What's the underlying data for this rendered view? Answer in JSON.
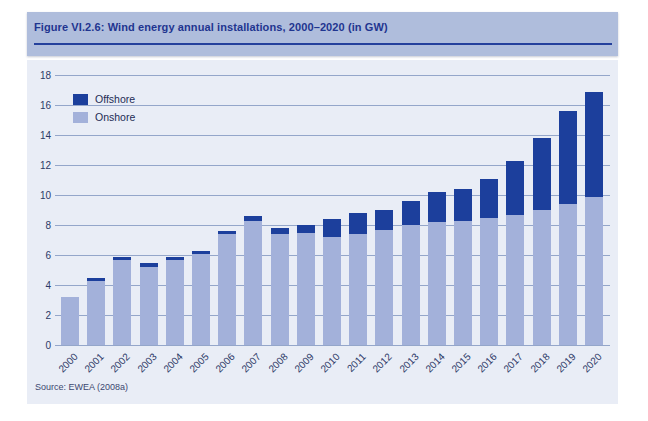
{
  "figure": {
    "title": "Figure VI.2.6: Wind energy annual installations, 2000–2020 (in GW)",
    "source": "Source: EWEA (2008a)"
  },
  "colors": {
    "title_band": "#afbddc",
    "panel_bg": "#e9edf6",
    "offshore": "#1c3f9c",
    "onshore": "#a3b1da",
    "gridline": "#94a6ca",
    "title_text": "#1f3590",
    "underline": "#24409c",
    "axis_text": "#2c3966",
    "source_text": "#3c4870"
  },
  "chart_data": {
    "type": "bar",
    "stacked": true,
    "title": "Wind energy annual installations, 2000–2020",
    "unit": "GW",
    "xlabel": "",
    "ylabel": "",
    "ylim": [
      0,
      18
    ],
    "yticks": [
      0,
      2,
      4,
      6,
      8,
      10,
      12,
      14,
      16,
      18
    ],
    "grid": true,
    "legend": [
      "Offshore",
      "Onshore"
    ],
    "legend_position": "upper-left",
    "categories": [
      "2000",
      "2001",
      "2002",
      "2003",
      "2004",
      "2005",
      "2006",
      "2007",
      "2008",
      "2009",
      "2010",
      "2011",
      "2012",
      "2013",
      "2014",
      "2015",
      "2016",
      "2017",
      "2018",
      "2019",
      "2020"
    ],
    "series": [
      {
        "name": "Onshore",
        "values": [
          3.2,
          4.3,
          5.7,
          5.2,
          5.7,
          6.1,
          7.4,
          8.3,
          7.4,
          7.5,
          7.2,
          7.4,
          7.7,
          8.0,
          8.2,
          8.3,
          8.5,
          8.7,
          9.0,
          9.4,
          9.9
        ]
      },
      {
        "name": "Offshore",
        "values": [
          0.0,
          0.2,
          0.2,
          0.3,
          0.2,
          0.2,
          0.2,
          0.3,
          0.4,
          0.5,
          1.2,
          1.4,
          1.3,
          1.6,
          2.0,
          2.1,
          2.6,
          3.6,
          4.8,
          6.2,
          7.0
        ]
      }
    ],
    "totals": [
      3.2,
      4.5,
      5.9,
      5.5,
      5.9,
      6.3,
      7.6,
      8.6,
      7.8,
      8.0,
      8.4,
      8.8,
      9.0,
      9.6,
      10.2,
      10.4,
      11.1,
      12.3,
      13.8,
      15.6,
      16.9
    ]
  }
}
